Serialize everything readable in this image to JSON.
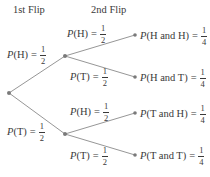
{
  "headers": {
    "first": "1st Flip",
    "second": "2nd Flip"
  },
  "colors": {
    "line": "#8a8a8a",
    "node": "#7a7a7a",
    "text": "#3a3a3a"
  },
  "nodes": {
    "root": {
      "x": 9,
      "y": 93
    },
    "h": {
      "x": 65,
      "y": 56
    },
    "t": {
      "x": 65,
      "y": 134
    },
    "hh": {
      "x": 135,
      "y": 35
    },
    "ht": {
      "x": 135,
      "y": 77
    },
    "th": {
      "x": 135,
      "y": 113
    },
    "tt": {
      "x": 135,
      "y": 155
    }
  },
  "first_flip": [
    {
      "p": "P",
      "event": "(H)",
      "num": "1",
      "den": "2"
    },
    {
      "p": "P",
      "event": "(T)",
      "num": "1",
      "den": "2"
    }
  ],
  "second_flip": [
    {
      "p": "P",
      "event": "(H)",
      "num": "1",
      "den": "2"
    },
    {
      "p": "P",
      "event": "(T)",
      "num": "1",
      "den": "2"
    },
    {
      "p": "P",
      "event": "(H)",
      "num": "1",
      "den": "2"
    },
    {
      "p": "P",
      "event": "(T)",
      "num": "1",
      "den": "2"
    }
  ],
  "outcomes": [
    {
      "p": "P",
      "event": "(H and H)",
      "num": "1",
      "den": "4"
    },
    {
      "p": "P",
      "event": "(H and T)",
      "num": "1",
      "den": "4"
    },
    {
      "p": "P",
      "event": "(T and H)",
      "num": "1",
      "den": "4"
    },
    {
      "p": "P",
      "event": "(T and T)",
      "num": "1",
      "den": "4"
    }
  ],
  "equals": "="
}
